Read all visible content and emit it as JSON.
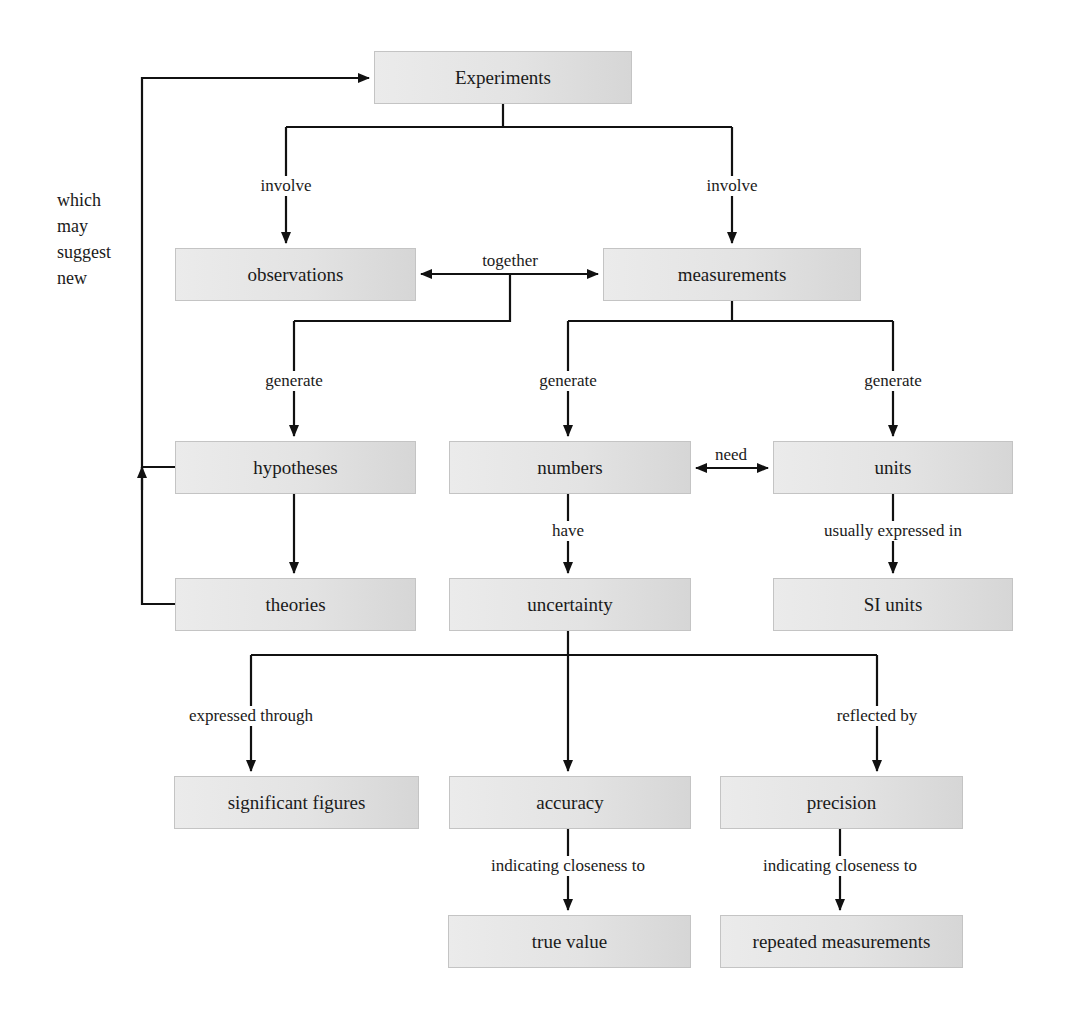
{
  "diagram": {
    "type": "concept-map",
    "nodes": {
      "experiments": "Experiments",
      "observations": "observations",
      "measurements": "measurements",
      "hypotheses": "hypotheses",
      "numbers": "numbers",
      "units": "units",
      "theories": "theories",
      "uncertainty": "uncertainty",
      "si_units": "SI units",
      "significant_figures": "significant figures",
      "accuracy": "accuracy",
      "precision": "precision",
      "true_value": "true value",
      "repeated_measurements": "repeated measurements"
    },
    "edge_labels": {
      "involve_left": "involve",
      "involve_right": "involve",
      "together": "together",
      "generate_hypotheses": "generate",
      "generate_numbers": "generate",
      "generate_units": "generate",
      "need": "need",
      "have": "have",
      "usually_expressed_in": "usually expressed in",
      "expressed_through": "expressed through",
      "reflected_by": "reflected by",
      "indicating_closeness_accuracy": "indicating closeness to",
      "indicating_closeness_precision": "indicating closeness to"
    },
    "feedback_label": {
      "line1": "which",
      "line2": "may",
      "line3": "suggest",
      "line4": "new"
    },
    "colors": {
      "line": "#111111",
      "node_fill": "#e4e4e4",
      "node_border": "#c4c4c4",
      "background": "#ffffff"
    }
  }
}
